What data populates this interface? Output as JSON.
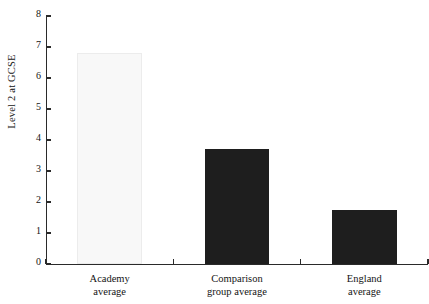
{
  "chart_data": {
    "type": "bar",
    "title": "",
    "xlabel": "",
    "ylabel": "Level 2 at GCSE",
    "categories": [
      "Academy average",
      "Comparison group average",
      "England average"
    ],
    "category_lines": [
      [
        "Academy",
        "average"
      ],
      [
        "Comparison",
        "group average"
      ],
      [
        "England",
        "average"
      ]
    ],
    "values": [
      6.8,
      3.7,
      1.75
    ],
    "ylim": [
      0,
      8
    ],
    "yticks": [
      0,
      1,
      2,
      3,
      4,
      5,
      6,
      7,
      8
    ],
    "ytick_labels": [
      "0",
      "1",
      "2",
      "3",
      "4",
      "5",
      "6",
      "7",
      "8"
    ],
    "grid": false,
    "legend": false,
    "bar_colors": [
      "#f8f8f8",
      "#1e1e1e",
      "#1e1e1e"
    ],
    "axis_color": "#2a2a2a"
  }
}
